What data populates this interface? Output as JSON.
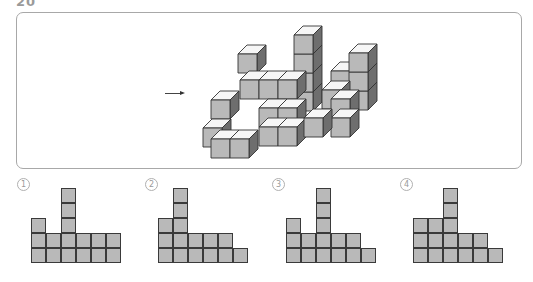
{
  "question": {
    "number": "20"
  },
  "figure": {
    "direction_arrow": "right-arrow",
    "colors": {
      "front": "#b9b9b9",
      "top": "#f6f6f6",
      "side": "#6e6e6e",
      "edge": "#333333"
    },
    "cube_size": 19,
    "depth_offset": 9,
    "cubes": [
      [
        331,
        71
      ],
      [
        349,
        91
      ],
      [
        349,
        72
      ],
      [
        349,
        53
      ],
      [
        238,
        54
      ],
      [
        294,
        92
      ],
      [
        294,
        73
      ],
      [
        294,
        54
      ],
      [
        294,
        35
      ],
      [
        240,
        80
      ],
      [
        259,
        80
      ],
      [
        278,
        80
      ],
      [
        322,
        90
      ],
      [
        331,
        99
      ],
      [
        331,
        118
      ],
      [
        211,
        100
      ],
      [
        259,
        108
      ],
      [
        278,
        108
      ],
      [
        259,
        127
      ],
      [
        278,
        127
      ],
      [
        304,
        118
      ],
      [
        203,
        128
      ],
      [
        211,
        139
      ],
      [
        230,
        139
      ]
    ]
  },
  "choices": [
    {
      "marker": "1",
      "left": 17,
      "grid_left": 31,
      "heights": [
        3,
        2,
        5,
        2,
        2,
        2
      ]
    },
    {
      "marker": "2",
      "left": 145,
      "grid_left": 158,
      "heights": [
        3,
        5,
        2,
        2,
        2,
        1
      ]
    },
    {
      "marker": "3",
      "left": 272,
      "grid_left": 286,
      "heights": [
        3,
        2,
        5,
        2,
        2,
        1
      ]
    },
    {
      "marker": "4",
      "left": 400,
      "grid_left": 413,
      "heights": [
        3,
        3,
        5,
        2,
        2,
        1
      ]
    }
  ],
  "grid_bottom": 263,
  "cell_size": 15
}
